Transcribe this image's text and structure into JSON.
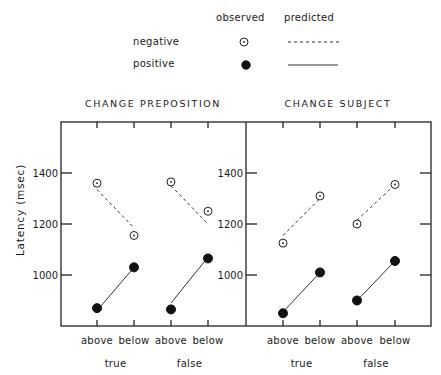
{
  "legend": {
    "col_observed": "observed",
    "col_predicted": "predicted",
    "rows": [
      {
        "label": "negative",
        "observed_marker": "open-circle-with-dot",
        "predicted_line": "dashed"
      },
      {
        "label": "positive",
        "observed_marker": "filled-circle",
        "predicted_line": "solid"
      }
    ]
  },
  "y_axis_label": "Latency (msec)",
  "chart_data": {
    "type": "line",
    "ylabel": "Latency (msec)",
    "ylim": [
      800,
      1600
    ],
    "yticks": [
      1000,
      1200,
      1400
    ],
    "grid": false,
    "legend_position": "top",
    "legend": [
      "negative observed",
      "negative predicted",
      "positive observed",
      "positive predicted"
    ],
    "panels": [
      {
        "title": "CHANGE PREPOSITION",
        "categories": [
          "above",
          "below",
          "above",
          "below"
        ],
        "groups": [
          "true",
          "false"
        ],
        "series": [
          {
            "name": "negative observed",
            "style": "open-circle",
            "values": [
              1360,
              1155,
              1365,
              1250
            ]
          },
          {
            "name": "positive observed",
            "style": "filled-circle",
            "values": [
              870,
              1030,
              865,
              1065
            ]
          },
          {
            "name": "negative predicted",
            "style": "dashed",
            "values": [
              1335,
              1185,
              1350,
              1200
            ]
          },
          {
            "name": "positive predicted",
            "style": "solid",
            "values": [
              860,
              1030,
              890,
              1070
            ]
          }
        ]
      },
      {
        "title": "CHANGE SUBJECT",
        "categories": [
          "above",
          "below",
          "above",
          "below"
        ],
        "groups": [
          "true",
          "false"
        ],
        "series": [
          {
            "name": "negative observed",
            "style": "open-circle",
            "values": [
              1125,
              1310,
              1200,
              1355
            ]
          },
          {
            "name": "positive observed",
            "style": "filled-circle",
            "values": [
              850,
              1010,
              900,
              1055
            ]
          },
          {
            "name": "negative predicted",
            "style": "dashed",
            "values": [
              1155,
              1300,
              1215,
              1355
            ]
          },
          {
            "name": "positive predicted",
            "style": "solid",
            "values": [
              855,
              1010,
              900,
              1055
            ]
          }
        ]
      }
    ]
  }
}
